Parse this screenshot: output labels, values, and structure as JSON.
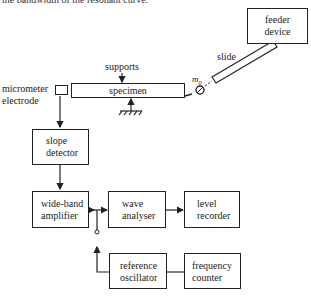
{
  "caption": "the bandwidth of the resonant curve.",
  "diagram": {
    "nodes": {
      "feeder": {
        "line1": "feeder",
        "line2": "device"
      },
      "slide": "slide",
      "supports": "supports",
      "specimen": "specimen",
      "mass": "m",
      "mass_sub": "0",
      "electrode": {
        "line1": "micrometer",
        "line2": "electrode"
      },
      "slope": {
        "line1": "slope",
        "line2": "detector"
      },
      "amplifier": {
        "line1": "wide-band",
        "line2": "amplifier"
      },
      "analyser": {
        "line1": "wave",
        "line2": "analyser"
      },
      "recorder": {
        "line1": "level",
        "line2": "recorder"
      },
      "oscillator": {
        "line1": "reference",
        "line2": "oscillator"
      },
      "counter": {
        "line1": "frequency",
        "line2": "counter"
      }
    },
    "edges": [
      {
        "from": "micrometer electrode",
        "to": "slope detector"
      },
      {
        "from": "slope detector",
        "to": "wide-band amplifier"
      },
      {
        "from": "wide-band amplifier",
        "to": "wave analyser",
        "via": "switch junction"
      },
      {
        "from": "wave analyser",
        "to": "level recorder"
      },
      {
        "from": "reference oscillator",
        "to": "switch junction"
      },
      {
        "from": "reference oscillator",
        "to": "frequency counter"
      },
      {
        "from": "feeder device",
        "to": "m0",
        "via": "slide"
      },
      {
        "from": "supports",
        "to": "specimen"
      },
      {
        "from": "ground",
        "to": "specimen"
      }
    ]
  }
}
